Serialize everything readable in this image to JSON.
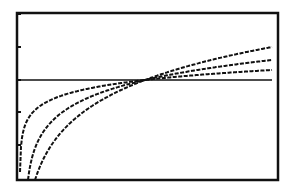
{
  "screen": {
    "title": "",
    "background": "#ffffff",
    "ink": "#111111"
  },
  "chart_data": {
    "type": "line",
    "title": "",
    "xlabel": "",
    "ylabel": "",
    "grid": false,
    "legend": null,
    "frame_px": {
      "left": 17,
      "top": 13,
      "right": 278,
      "bottom": 180
    },
    "x_axis_y_px": 80,
    "y_ticks_px": [
      14,
      47,
      80,
      112,
      145
    ],
    "crossing_x_px": 145,
    "series": [
      {
        "name": "curve-1",
        "start_px": [
          20,
          180
        ],
        "end_px": [
          272,
          70
        ],
        "shape": "logarithmic"
      },
      {
        "name": "curve-2",
        "start_px": [
          28,
          180
        ],
        "end_px": [
          272,
          60
        ],
        "shape": "logarithmic"
      },
      {
        "name": "curve-3",
        "start_px": [
          35,
          180
        ],
        "end_px": [
          272,
          47
        ],
        "shape": "logarithmic"
      }
    ]
  }
}
